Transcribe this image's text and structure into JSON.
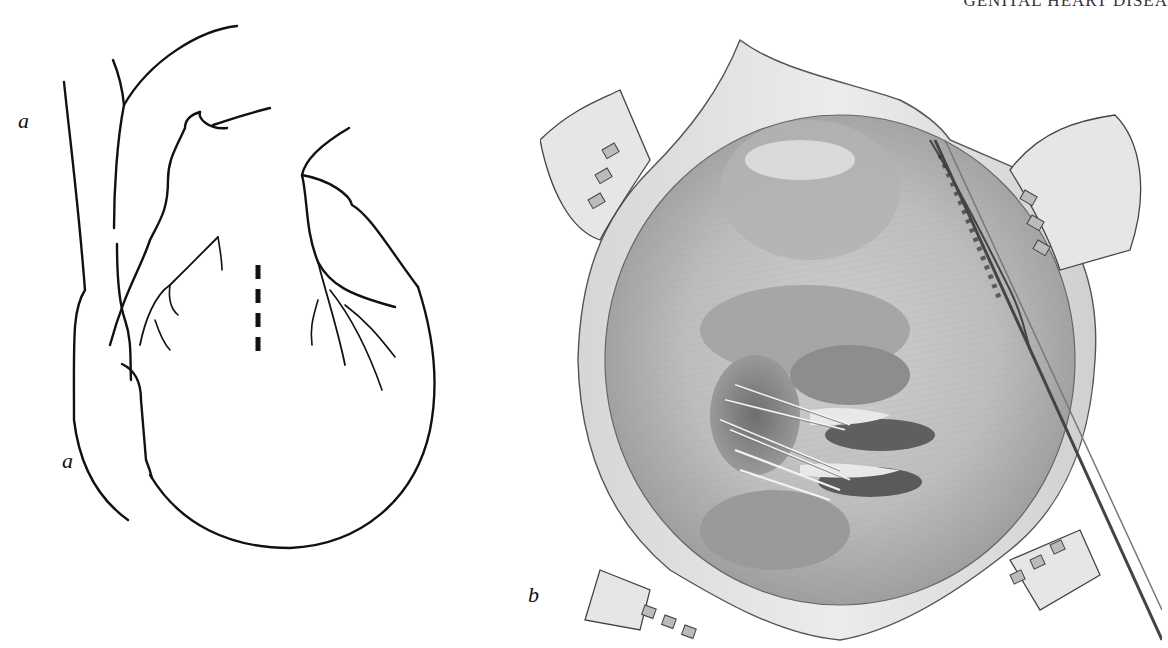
{
  "page": {
    "running_header": "GENITAL HEART DISEA",
    "figures": [
      {
        "id": "a",
        "label_top": "a",
        "label_bottom": "a",
        "description": "Line drawing of the anterior surface of the heart with great vessels; dashed line marks incision site"
      },
      {
        "id": "b",
        "label": "b",
        "description": "Shaded surgical illustration of an opened cardiac chamber held by retractors, showing valve leaflets with traction sutures and an instrument at right"
      }
    ]
  }
}
